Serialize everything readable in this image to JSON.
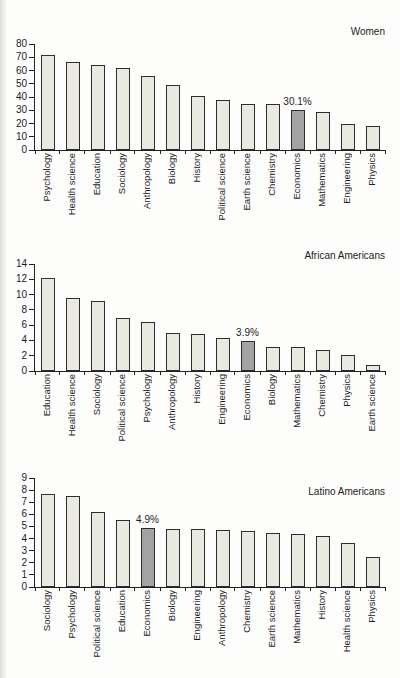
{
  "colors": {
    "background": "#fdfdfc",
    "bar_fill": "#e9e9e2",
    "bar_highlight": "#a3a3a3",
    "bar_border": "#2d2d2d",
    "axis": "#222222",
    "text": "#1c1c1c"
  },
  "chart_data": [
    {
      "type": "bar",
      "title": "Women",
      "categories": [
        "Psychology",
        "Health science",
        "Education",
        "Sociology",
        "Anthropology",
        "Biology",
        "History",
        "Political science",
        "Earth science",
        "Chemistry",
        "Economics",
        "Mathematics",
        "Engineering",
        "Physics"
      ],
      "values": [
        72,
        66.5,
        64.5,
        62,
        56,
        49,
        40.5,
        38,
        35,
        34.5,
        30.1,
        29,
        19.5,
        18.5
      ],
      "highlight_category": "Economics",
      "highlight_label": "30.1%",
      "xlabel": "",
      "ylabel": "",
      "ylim": [
        0,
        80
      ],
      "yticks": [
        0,
        10,
        20,
        30,
        40,
        50,
        60,
        70,
        80
      ],
      "grid": false,
      "legend_position": "none",
      "x_label_rotation": 90
    },
    {
      "type": "bar",
      "title": "African Americans",
      "categories": [
        "Education",
        "Health science",
        "Sociology",
        "Political science",
        "Psychology",
        "Anthropology",
        "History",
        "Engineering",
        "Economics",
        "Biology",
        "Mathematics",
        "Chemistry",
        "Physics",
        "Earth science"
      ],
      "values": [
        12.2,
        9.5,
        9.1,
        6.9,
        6.4,
        5.0,
        4.9,
        4.3,
        3.9,
        3.2,
        3.1,
        2.7,
        2.1,
        0.8
      ],
      "highlight_category": "Economics",
      "highlight_label": "3.9%",
      "xlabel": "",
      "ylabel": "",
      "ylim": [
        0,
        14
      ],
      "yticks": [
        0,
        2,
        4,
        6,
        8,
        10,
        12,
        14
      ],
      "grid": false,
      "legend_position": "none",
      "x_label_rotation": 90
    },
    {
      "type": "bar",
      "title": "Latino Americans",
      "categories": [
        "Sociology",
        "Psychology",
        "Political science",
        "Education",
        "Economics",
        "Biology",
        "Engineering",
        "Anthropology",
        "Chemistry",
        "Earth science",
        "Mathematics",
        "History",
        "Health science",
        "Physics"
      ],
      "values": [
        7.7,
        7.5,
        6.2,
        5.5,
        4.9,
        4.8,
        4.8,
        4.7,
        4.6,
        4.5,
        4.4,
        4.2,
        3.6,
        2.5
      ],
      "highlight_category": "Economics",
      "highlight_label": "4.9%",
      "xlabel": "",
      "ylabel": "",
      "ylim": [
        0,
        9
      ],
      "yticks": [
        0,
        1,
        2,
        3,
        4,
        5,
        6,
        7,
        8,
        9
      ],
      "grid": false,
      "legend_position": "none",
      "x_label_rotation": 90
    }
  ]
}
